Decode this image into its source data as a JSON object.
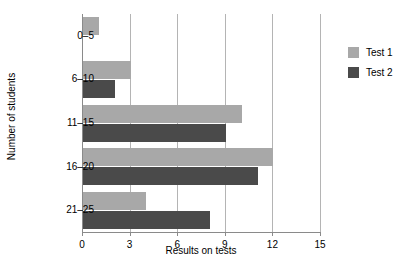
{
  "chart_data": {
    "type": "bar",
    "orientation": "horizontal",
    "title": "",
    "xlabel": "Results on tests",
    "ylabel": "Number of students",
    "categories": [
      "0–5",
      "6–10",
      "11–15",
      "16–20",
      "21–25"
    ],
    "series": [
      {
        "name": "Test 1",
        "color": "#a8a8a8",
        "values": [
          1,
          3,
          10,
          12,
          4
        ]
      },
      {
        "name": "Test 2",
        "color": "#4a4a4a",
        "values": [
          0,
          2,
          9,
          11,
          8
        ]
      }
    ],
    "xlim": [
      0,
      15
    ],
    "xticks": [
      0,
      3,
      6,
      9,
      12,
      15
    ],
    "xtick_labels": [
      "0",
      "3",
      "6",
      "9",
      "12",
      "15"
    ],
    "grid": "vertical",
    "legend_position": "right"
  }
}
